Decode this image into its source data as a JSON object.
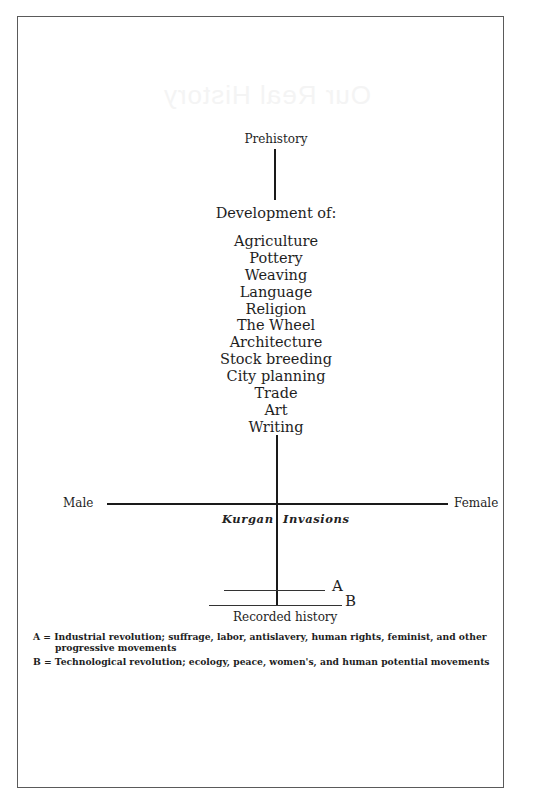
{
  "ghost_title": "Our Real History",
  "diagram": {
    "top_label": "Prehistory",
    "development_heading": "Development of:",
    "developments": [
      "Agriculture",
      "Pottery",
      "Weaving",
      "Language",
      "Religion",
      "The Wheel",
      "Architecture",
      "Stock breeding",
      "City planning",
      "Trade",
      "Art",
      "Writing"
    ],
    "axis_left_label": "Male",
    "axis_right_label": "Female",
    "invasion_left": "Kurgan",
    "invasion_right": "Invasions",
    "marker_a": "A",
    "marker_b": "B",
    "bottom_label": "Recorded history"
  },
  "legend": {
    "a_line1": "A = Industrial revolution; suffrage, labor, antislavery, human rights, feminist, and other",
    "a_line2": "progressive movements",
    "b_line1": "B = Technological revolution; ecology, peace, women's, and human potential movements"
  }
}
